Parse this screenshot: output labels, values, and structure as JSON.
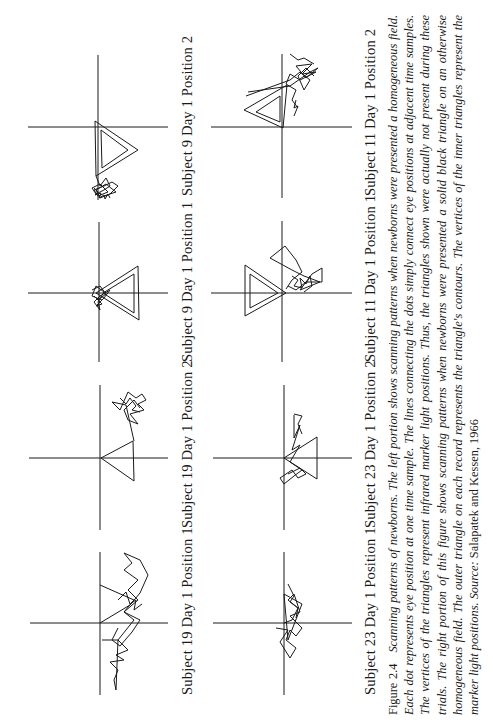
{
  "figure": {
    "orientation": "rotated 90deg counter-clockwise (page printed landscape)",
    "panels": [
      {
        "label": "Subject 9 Day 1 Position 2"
      },
      {
        "label": "Subject 9 Day 1 Position 1"
      },
      {
        "label": "Subject 19 Day 1 Position 2"
      },
      {
        "label": "Subject 19 Day 1 Position 1"
      },
      {
        "label": "Subject 11 Day 1 Position 2"
      },
      {
        "label": "Subject 11 Day 1 Position 1"
      },
      {
        "label": "Subject 23 Day 1 Position 2"
      },
      {
        "label": "Subject 23 Day 1 Position 1"
      }
    ],
    "caption": {
      "number": "Figure 2.4",
      "text": "Scanning patterns of newborns. The left portion shows scanning patterns when newborns were presented a homogeneous field. Each dot represents eye position at one time sample. The lines connecting the dots simply connect eye positions at adjacent time samples. The vertices of the triangles represent infrared marker light positions. Thus, the triangles shown were actually not present during these trials. The right portion of this figure shows scanning patterns when newborns were presented a solid black triangle on an otherwise homogeneous field. The outer triangle on each record represents the triangle's contours. The vertices of the inner triangles represent the marker light positions.",
      "source_label": "Source:",
      "source": "Salapatek and Kessen, 1966"
    }
  }
}
